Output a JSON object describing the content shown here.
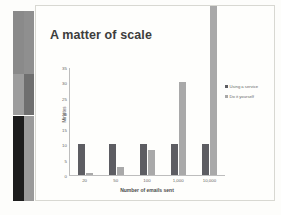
{
  "slide": {
    "title": "A matter of scale"
  },
  "scan_strips": [
    {
      "name": "strip-left",
      "segments": [
        "#8a8a8a",
        "#9d9d9d",
        "#1c1c1c"
      ]
    },
    {
      "name": "strip-right",
      "segments": [
        "#8f8f8f",
        "#6f6f6f",
        "#9a9a9a"
      ]
    }
  ],
  "colors": {
    "series_dark": "#5d5d62",
    "series_light": "#a9a9a9",
    "slide_bg": "#fefefc",
    "axis": "#bdbdbd",
    "title_text": "#3d3d3d"
  },
  "chart_data": {
    "type": "bar",
    "title": "A matter of scale",
    "xlabel": "Number of emails sent",
    "ylabel": "Minutes",
    "categories": [
      "20",
      "50",
      "100",
      "1,000",
      "10,000"
    ],
    "series": [
      {
        "name": "Using a service",
        "values": [
          10,
          10,
          10,
          10,
          10
        ]
      },
      {
        "name": "Do it yourself",
        "values": [
          0.5,
          2.5,
          8,
          30,
          75
        ]
      }
    ],
    "ylim": [
      0,
      35
    ],
    "yticks": [
      0,
      5,
      10,
      15,
      20,
      25,
      30,
      35
    ],
    "grid": false,
    "legend_position": "top-right"
  }
}
